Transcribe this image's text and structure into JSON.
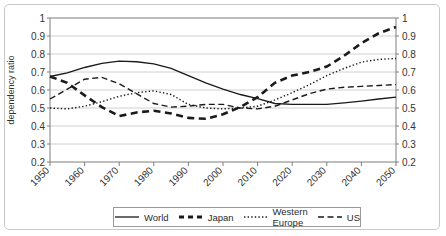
{
  "chart_data": {
    "type": "line",
    "title": "",
    "xlabel": "",
    "ylabel": "dependency ratio",
    "xlim": [
      1950,
      2050
    ],
    "ylim": [
      0.2,
      1.0
    ],
    "grid": true,
    "legend_position": "bottom",
    "x_ticks": [
      "1950",
      "1960",
      "1970",
      "1980",
      "1990",
      "2000",
      "2010",
      "2020",
      "2030",
      "2040",
      "2050"
    ],
    "y_ticks": [
      "0.2",
      "0.3",
      "0.4",
      "0.5",
      "0.6",
      "0.7",
      "0.8",
      "0.9",
      "1"
    ],
    "y_ticks_right": [
      "0.2",
      "0.3",
      "0.4",
      "0.5",
      "0.6",
      "0.7",
      "0.8",
      "0.9",
      "1"
    ],
    "x": [
      1950,
      1955,
      1960,
      1965,
      1970,
      1975,
      1980,
      1985,
      1990,
      1995,
      2000,
      2005,
      2010,
      2015,
      2020,
      2025,
      2030,
      2035,
      2040,
      2045,
      2050
    ],
    "series": [
      {
        "name": "World",
        "style": "solid",
        "values": [
          0.675,
          0.695,
          0.725,
          0.748,
          0.76,
          0.757,
          0.745,
          0.72,
          0.68,
          0.64,
          0.605,
          0.575,
          0.552,
          0.525,
          0.52,
          0.52,
          0.52,
          0.528,
          0.538,
          0.55,
          0.56
        ]
      },
      {
        "name": "Japan",
        "style": "dashed-thick",
        "values": [
          0.675,
          0.64,
          0.57,
          0.505,
          0.455,
          0.475,
          0.485,
          0.47,
          0.445,
          0.44,
          0.465,
          0.505,
          0.56,
          0.64,
          0.68,
          0.7,
          0.73,
          0.79,
          0.86,
          0.915,
          0.95
        ]
      },
      {
        "name": "Western Europe",
        "style": "dotted",
        "values": [
          0.5,
          0.495,
          0.51,
          0.535,
          0.565,
          0.585,
          0.595,
          0.575,
          0.52,
          0.5,
          0.495,
          0.5,
          0.51,
          0.545,
          0.585,
          0.63,
          0.68,
          0.72,
          0.755,
          0.77,
          0.775
        ]
      },
      {
        "name": "US",
        "style": "dashed",
        "values": [
          0.55,
          0.605,
          0.66,
          0.67,
          0.635,
          0.58,
          0.525,
          0.505,
          0.51,
          0.52,
          0.52,
          0.5,
          0.495,
          0.51,
          0.545,
          0.58,
          0.605,
          0.615,
          0.62,
          0.625,
          0.63
        ]
      }
    ]
  },
  "legend": {
    "items": [
      {
        "label": "World",
        "style": "solid"
      },
      {
        "label": "Japan",
        "style": "dashed-thick"
      },
      {
        "label": "Western Europe",
        "style": "dotted"
      },
      {
        "label": "US",
        "style": "dashed"
      }
    ]
  }
}
